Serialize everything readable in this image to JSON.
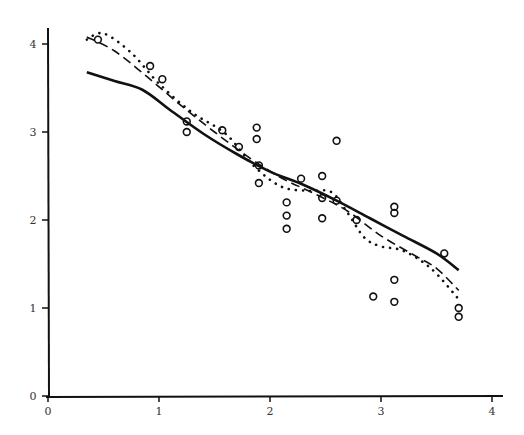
{
  "chart_data": {
    "type": "scatter",
    "title": "",
    "xlabel": "",
    "ylabel": "",
    "xlim": [
      0,
      4.1
    ],
    "ylim": [
      0,
      4.2
    ],
    "grid": false,
    "legend": null,
    "x_ticks": [
      "0",
      "1",
      "2",
      "3",
      "4"
    ],
    "y_ticks": [
      "0",
      "1",
      "2",
      "3",
      "4"
    ],
    "points": [
      [
        0.45,
        4.05
      ],
      [
        0.92,
        3.75
      ],
      [
        1.03,
        3.6
      ],
      [
        1.25,
        3.12
      ],
      [
        1.25,
        3.0
      ],
      [
        1.57,
        3.02
      ],
      [
        1.72,
        2.83
      ],
      [
        1.88,
        3.05
      ],
      [
        1.88,
        2.92
      ],
      [
        1.9,
        2.62
      ],
      [
        1.9,
        2.42
      ],
      [
        2.15,
        2.2
      ],
      [
        2.15,
        2.05
      ],
      [
        2.15,
        1.9
      ],
      [
        2.28,
        2.47
      ],
      [
        2.47,
        2.5
      ],
      [
        2.47,
        2.25
      ],
      [
        2.47,
        2.02
      ],
      [
        2.6,
        2.9
      ],
      [
        2.6,
        2.22
      ],
      [
        2.78,
        2.0
      ],
      [
        2.93,
        1.13
      ],
      [
        3.12,
        2.15
      ],
      [
        3.12,
        2.08
      ],
      [
        3.12,
        1.32
      ],
      [
        3.12,
        1.07
      ],
      [
        3.57,
        1.62
      ],
      [
        3.7,
        1.0
      ],
      [
        3.7,
        0.9
      ]
    ],
    "series": [
      {
        "name": "solid-smooth",
        "style": "solid",
        "x": [
          0.35,
          0.6,
          0.85,
          1.1,
          1.4,
          1.7,
          2.0,
          2.3,
          2.6,
          2.9,
          3.2,
          3.5,
          3.7
        ],
        "y": [
          3.68,
          3.58,
          3.48,
          3.25,
          2.98,
          2.75,
          2.55,
          2.4,
          2.22,
          2.02,
          1.82,
          1.62,
          1.43
        ]
      },
      {
        "name": "dashed-smooth",
        "style": "dashed",
        "x": [
          0.35,
          0.6,
          0.9,
          1.2,
          1.5,
          1.8,
          2.1,
          2.4,
          2.7,
          3.0,
          3.3,
          3.5,
          3.7
        ],
        "y": [
          4.08,
          3.92,
          3.62,
          3.3,
          3.0,
          2.72,
          2.48,
          2.3,
          2.1,
          1.82,
          1.6,
          1.45,
          1.2
        ]
      },
      {
        "name": "dotted-smooth",
        "style": "dotted",
        "x": [
          0.35,
          0.5,
          0.75,
          1.0,
          1.3,
          1.6,
          1.85,
          2.1,
          2.35,
          2.55,
          2.7,
          2.85,
          3.0,
          3.2,
          3.45,
          3.7
        ],
        "y": [
          4.05,
          4.12,
          3.9,
          3.55,
          3.22,
          2.98,
          2.62,
          2.38,
          2.33,
          2.32,
          2.08,
          1.8,
          1.7,
          1.65,
          1.45,
          1.1
        ]
      }
    ]
  }
}
